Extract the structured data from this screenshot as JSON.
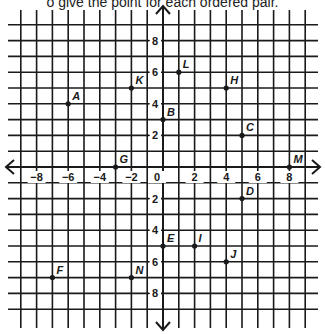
{
  "instruction": "o give the point for each ordered pair.",
  "chart_data": {
    "type": "scatter",
    "title": "",
    "xlabel": "",
    "ylabel": "",
    "xlim": [
      -9,
      9
    ],
    "ylim": [
      -9,
      9
    ],
    "grid": true,
    "x_ticks": [
      -8,
      -6,
      -4,
      -2,
      0,
      2,
      4,
      6,
      8
    ],
    "x_tick_labels": [
      "−8",
      "−6",
      "−4",
      "−2",
      "0",
      "2",
      "4",
      "6",
      "8"
    ],
    "y_ticks": [
      8,
      6,
      4,
      2,
      -2,
      -4,
      -6,
      -8
    ],
    "y_tick_labels": [
      "8",
      "6",
      "4",
      "2",
      "2",
      "4",
      "6",
      "8"
    ],
    "points": [
      {
        "label": "A",
        "x": -6,
        "y": 4
      },
      {
        "label": "B",
        "x": 0,
        "y": 3
      },
      {
        "label": "C",
        "x": 5,
        "y": 2
      },
      {
        "label": "D",
        "x": 5,
        "y": -2
      },
      {
        "label": "E",
        "x": 0,
        "y": -5
      },
      {
        "label": "F",
        "x": -7,
        "y": -7
      },
      {
        "label": "G",
        "x": -3,
        "y": 0
      },
      {
        "label": "H",
        "x": 4,
        "y": 5
      },
      {
        "label": "I",
        "x": 2,
        "y": -5
      },
      {
        "label": "J",
        "x": 4,
        "y": -6
      },
      {
        "label": "K",
        "x": -2,
        "y": 5
      },
      {
        "label": "L",
        "x": 1,
        "y": 6
      },
      {
        "label": "M",
        "x": 8,
        "y": 0
      },
      {
        "label": "N",
        "x": -2,
        "y": -7
      }
    ],
    "colors": {
      "line": "#1a1a1a",
      "background": "#ffffff"
    }
  }
}
